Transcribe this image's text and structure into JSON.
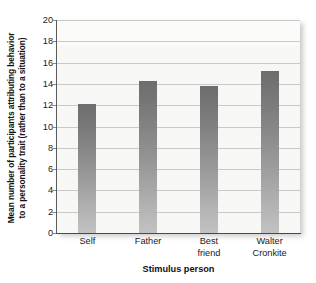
{
  "chart_data": {
    "type": "bar",
    "title": "",
    "categories": [
      "Self",
      "Father",
      "Best friend",
      "Walter Cronkite"
    ],
    "category_lines": [
      [
        "Self"
      ],
      [
        "Father"
      ],
      [
        "Best",
        "friend"
      ],
      [
        "Walter",
        "Cronkite"
      ]
    ],
    "values": [
      12.1,
      14.3,
      13.8,
      15.2
    ],
    "xlabel": "Stimulus person",
    "ylabel": "Mean number of participants attributing behavior to a personality trait (rather than to a situation)",
    "ylabel_lines": [
      "Mean number of participants attributing behavior",
      "to a personality trait (rather than to a situation)"
    ],
    "ylim": [
      0,
      20
    ],
    "ytick_labels": [
      "20",
      "18",
      "16",
      "14",
      "12",
      "10",
      "8",
      "6",
      "4",
      "2",
      "0"
    ],
    "ytick_values": [
      20,
      18,
      16,
      14,
      12,
      10,
      8,
      6,
      4,
      2,
      0
    ],
    "grid": "horizontal",
    "legend": "none",
    "colors": {
      "bar_top": "#6d6d6d",
      "bar_bottom": "#c2c2c2",
      "plot_background": "#f7f7f5",
      "gridline": "#c9c9c9",
      "axis": "#4a4a4a",
      "text": "#1a1a1a"
    }
  }
}
